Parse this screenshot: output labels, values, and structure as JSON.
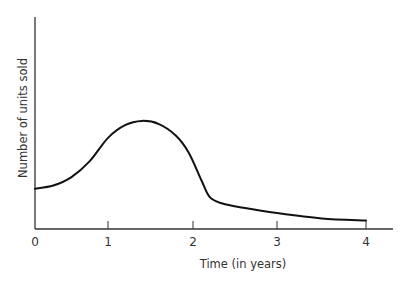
{
  "chart_data": {
    "type": "line",
    "title": "",
    "xlabel": "Time (in years)",
    "ylabel": "Number of units sold",
    "xlim": [
      0,
      4.3
    ],
    "ylim": [
      0,
      10
    ],
    "xticks": [
      0,
      1,
      2,
      3,
      4
    ],
    "xtick_labels": [
      "0",
      "1",
      "2",
      "3",
      "4"
    ],
    "yticks": [],
    "grid": false,
    "legend": null,
    "series": [
      {
        "name": "Units sold",
        "x": [
          0,
          0.25,
          0.5,
          0.75,
          1.0,
          1.2,
          1.4,
          1.6,
          1.8,
          1.95,
          2.1,
          2.2,
          2.35,
          2.6,
          3.0,
          3.5,
          4.0
        ],
        "y": [
          1.9,
          2.05,
          2.45,
          3.2,
          4.3,
          4.9,
          5.1,
          4.95,
          4.4,
          3.6,
          2.3,
          1.5,
          1.2,
          1.0,
          0.75,
          0.5,
          0.4
        ]
      }
    ]
  }
}
